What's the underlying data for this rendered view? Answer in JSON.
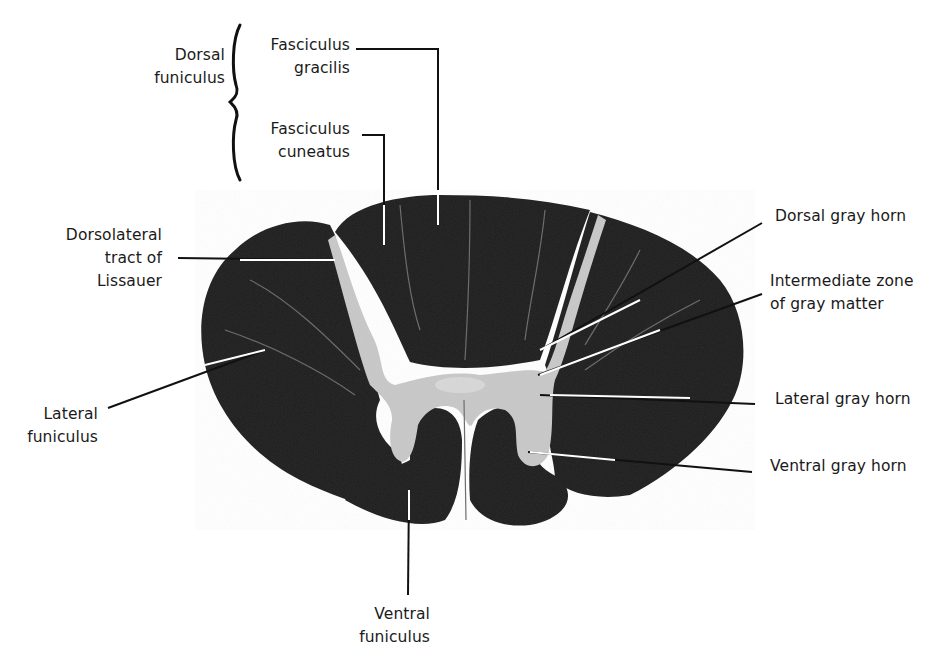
{
  "figure": {
    "labels": {
      "dorsal_funiculus": "Dorsal\nfuniculus",
      "fasciculus_gracilis": "Fasciculus\ngracilis",
      "fasciculus_cuneatus": "Fasciculus\ncuneatus",
      "dorsolateral_tract": "Dorsolateral\ntract of\nLissauer",
      "lateral_funiculus": "Lateral\nfuniculus",
      "dorsal_gray_horn": "Dorsal gray horn",
      "intermediate_zone": "Intermediate zone\nof gray matter",
      "lateral_gray_horn": "Lateral gray horn",
      "ventral_gray_horn": "Ventral gray horn",
      "ventral_funiculus": "Ventral\nfuniculus"
    },
    "colors": {
      "white_matter": "#1e1e1e",
      "gray_matter": "#c8c8c8",
      "background": "#ffffff",
      "leader": "#111111"
    }
  }
}
